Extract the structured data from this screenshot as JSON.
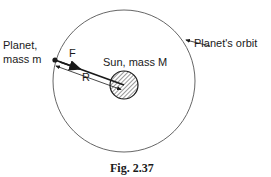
{
  "figure": {
    "caption": "Fig. 2.37",
    "labels": {
      "planet_line1": "Planet,",
      "planet_line2": "mass m",
      "force": "F",
      "radius": "R",
      "sun": "Sun, mass M",
      "orbit": "Planet's orbit"
    },
    "colors": {
      "ink": "#1a1a1a",
      "orbit_line": "#555555",
      "background": "#ffffff"
    }
  }
}
